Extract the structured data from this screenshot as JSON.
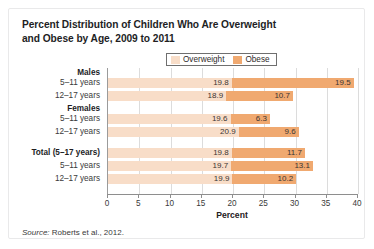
{
  "title": "Percent Distribution of Children Who Are Overweight and Obese by Age, 2009 to 2011",
  "title_line1": "Percent Distribution of Children Who Are Overweight",
  "title_line2": "and Obese by Age, 2009 to 2011",
  "legend": {
    "items": [
      {
        "label": "Overweight",
        "color": "#f8ddc8"
      },
      {
        "label": "Obese",
        "color": "#f0a970"
      }
    ]
  },
  "source": {
    "keyword": "Source:",
    "text": "Roberts et al., 2012."
  },
  "chart_data": {
    "type": "bar",
    "orientation": "horizontal",
    "stacked": true,
    "title": "Percent Distribution of Children Who Are Overweight and Obese by Age, 2009 to 2011",
    "xlabel": "Percent",
    "ylabel": "",
    "xlim": [
      0,
      40
    ],
    "xticks": [
      0,
      5,
      10,
      15,
      20,
      25,
      30,
      35,
      40
    ],
    "xtick_labels": [
      "0",
      "5",
      "10",
      "15",
      "20",
      "25",
      "30",
      "35",
      "40"
    ],
    "grid": "vertical",
    "legend_position": "top-center",
    "categories": [
      "Males 5-11 years",
      "Males 12-17 years",
      "Females 5-11 years",
      "Females 12-17 years",
      "Total (5-17 years)",
      "Total 5-11 years",
      "Total 12-17 years"
    ],
    "series": [
      {
        "name": "Overweight",
        "color": "#f8ddc8",
        "values": [
          19.8,
          18.9,
          19.6,
          20.9,
          19.8,
          19.7,
          19.9
        ]
      },
      {
        "name": "Obese",
        "color": "#f0a970",
        "values": [
          19.5,
          10.7,
          6.3,
          9.6,
          11.7,
          13.1,
          10.2
        ]
      }
    ],
    "groups": [
      {
        "header": "Males",
        "rows": [
          {
            "label": "5–11 years",
            "overweight": 19.8,
            "obese": 19.5
          },
          {
            "label": "12–17 years",
            "overweight": 18.9,
            "obese": 10.7
          }
        ]
      },
      {
        "header": "Females",
        "rows": [
          {
            "label": "5–11 years",
            "overweight": 19.6,
            "obese": 6.3
          },
          {
            "label": "12–17 years",
            "overweight": 20.9,
            "obese": 9.6
          }
        ]
      },
      {
        "header": "Total (5–17 years)",
        "header_has_bar": true,
        "rows": [
          {
            "label": "Total (5–17 years)",
            "overweight": 19.8,
            "obese": 11.7
          },
          {
            "label": "5–11 years",
            "overweight": 19.7,
            "obese": 13.1
          },
          {
            "label": "12–17 years",
            "overweight": 19.9,
            "obese": 10.2
          }
        ]
      }
    ]
  }
}
